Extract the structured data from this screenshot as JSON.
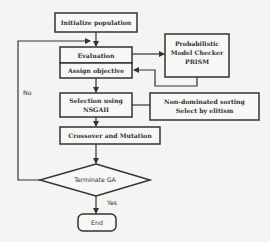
{
  "diagram": {
    "type": "flowchart",
    "nodes": {
      "init": {
        "label": "Initialize population"
      },
      "evaluation": {
        "label": "Evaluation"
      },
      "assign": {
        "label": "Assign objective"
      },
      "prism": {
        "line1": "Probabilistic",
        "line2": "Model Checker",
        "line3": "PRISM"
      },
      "selection": {
        "line1": "Selection using",
        "line2": "NSGAII"
      },
      "nondominated": {
        "line1": "Non-dominated sorting",
        "line2": "Select by elitism"
      },
      "crossover": {
        "label": "Crossover and Mutation"
      },
      "terminate": {
        "label": "Terminate GA"
      },
      "end": {
        "label": "End"
      }
    },
    "edge_labels": {
      "no": "No",
      "yes": "Yes"
    },
    "colors": {
      "stroke": "#333333",
      "background": "#f4f4f2",
      "box_fill": "#f7f7f5"
    }
  }
}
